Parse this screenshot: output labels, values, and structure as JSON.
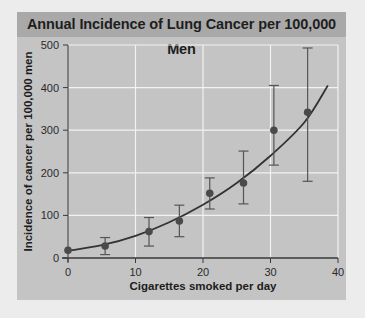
{
  "chart_data": {
    "type": "scatter",
    "title": "Annual Incidence of Lung Cancer per 100,000 Men",
    "xlabel": "Cigarettes smoked per day",
    "ylabel": "Incidence of cancer per 100,000 men",
    "xlim": [
      0,
      40
    ],
    "ylim": [
      0,
      500
    ],
    "xticks": [
      0,
      10,
      20,
      30,
      40
    ],
    "yticks": [
      0,
      100,
      200,
      300,
      400,
      500
    ],
    "grid": true,
    "legend": null,
    "series": [
      {
        "name": "Observed incidence",
        "kind": "points_with_error_bars",
        "x": [
          0,
          5.5,
          12,
          16.5,
          21,
          26,
          30.5,
          35.5
        ],
        "y": [
          18,
          28,
          62,
          87,
          152,
          176,
          300,
          342
        ],
        "err_low": [
          18,
          8,
          28,
          50,
          115,
          127,
          218,
          180
        ],
        "err_high": [
          18,
          48,
          95,
          124,
          188,
          251,
          405,
          493
        ]
      },
      {
        "name": "Fitted curve",
        "kind": "line",
        "x": [
          0,
          5,
          10,
          15,
          20,
          25,
          30,
          35,
          38.5
        ],
        "y": [
          17,
          30,
          52,
          84,
          125,
          176,
          240,
          318,
          405
        ]
      }
    ]
  },
  "colors": {
    "background": "#ececec",
    "panel": "#c4c4c4",
    "title_bar": "#a9a9a9",
    "grid": "#f2f2f2",
    "marker": "#4a4a4a",
    "line": "#333333"
  }
}
